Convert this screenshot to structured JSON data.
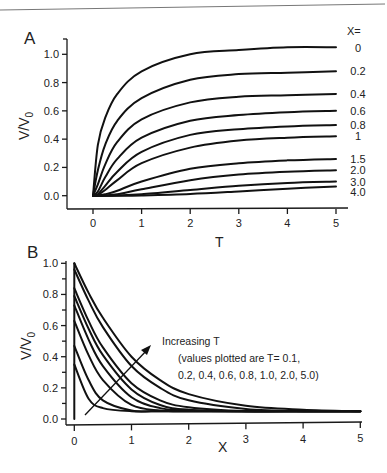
{
  "chart_data": [
    {
      "panel": "A",
      "type": "line",
      "title": "",
      "xlabel": "T",
      "ylabel": "V/V0",
      "xlim": [
        -0.5,
        5.1
      ],
      "ylim": [
        -0.1,
        1.1
      ],
      "xticks": [
        "0",
        "1",
        "2",
        "3",
        "4",
        "5"
      ],
      "yticks": [
        "0.0",
        "0.2",
        "0.4",
        "0.6",
        "0.8",
        "1.0"
      ],
      "legend_title": "X=",
      "grid": false,
      "x": [
        0,
        0.1,
        0.25,
        0.5,
        1,
        2,
        3,
        4,
        5
      ],
      "series": [
        {
          "name": "0",
          "values": [
            0,
            0.36,
            0.55,
            0.72,
            0.88,
            1.0,
            1.03,
            1.05,
            1.05
          ]
        },
        {
          "name": "0.2",
          "values": [
            0,
            0.18,
            0.36,
            0.53,
            0.69,
            0.82,
            0.86,
            0.87,
            0.88
          ]
        },
        {
          "name": "0.4",
          "values": [
            0,
            0.08,
            0.22,
            0.38,
            0.54,
            0.66,
            0.7,
            0.71,
            0.72
          ]
        },
        {
          "name": "0.6",
          "values": [
            0,
            0.03,
            0.13,
            0.26,
            0.41,
            0.53,
            0.57,
            0.59,
            0.6
          ]
        },
        {
          "name": "0.8",
          "values": [
            0,
            0.01,
            0.07,
            0.17,
            0.31,
            0.43,
            0.47,
            0.49,
            0.5
          ]
        },
        {
          "name": "1",
          "values": [
            0,
            0.005,
            0.04,
            0.11,
            0.23,
            0.34,
            0.39,
            0.41,
            0.42
          ]
        },
        {
          "name": "1.5",
          "values": [
            0,
            0,
            0.01,
            0.035,
            0.1,
            0.19,
            0.23,
            0.25,
            0.26
          ]
        },
        {
          "name": "2.0",
          "values": [
            0,
            0,
            0.002,
            0.01,
            0.045,
            0.11,
            0.15,
            0.17,
            0.18
          ]
        },
        {
          "name": "3.0",
          "values": [
            0,
            0,
            0,
            0.002,
            0.01,
            0.04,
            0.07,
            0.09,
            0.1
          ]
        },
        {
          "name": "4.0",
          "values": [
            0,
            0,
            0,
            0,
            0.002,
            0.012,
            0.03,
            0.05,
            0.065
          ]
        }
      ]
    },
    {
      "panel": "B",
      "type": "line",
      "title": "",
      "xlabel": "X",
      "ylabel": "V/V0",
      "xlim": [
        -0.1,
        5.1
      ],
      "ylim": [
        -0.04,
        1.02
      ],
      "xticks": [
        "0",
        "1",
        "2",
        "3",
        "4",
        "5"
      ],
      "yticks": [
        "0.0",
        "0.2",
        "0.4",
        "0.6",
        "0.8",
        "1.0"
      ],
      "grid": false,
      "annotation": {
        "line1": "Increasing T",
        "line2": "(values plotted are T= 0.1,",
        "line3": "0.2, 0.4, 0.6, 0.8, 1.0, 2.0, 5.0)"
      },
      "x": [
        0,
        0.25,
        0.5,
        1,
        1.5,
        2,
        3,
        4,
        5
      ],
      "series": [
        {
          "name": "T=0.1",
          "values": [
            0.35,
            0.13,
            0.07,
            0.05,
            0.05,
            0.05,
            0.05,
            0.05,
            0.05
          ]
        },
        {
          "name": "T=0.2",
          "values": [
            0.47,
            0.25,
            0.12,
            0.055,
            0.05,
            0.05,
            0.05,
            0.05,
            0.05
          ]
        },
        {
          "name": "T=0.4",
          "values": [
            0.63,
            0.41,
            0.25,
            0.09,
            0.055,
            0.05,
            0.05,
            0.05,
            0.05
          ]
        },
        {
          "name": "T=0.6",
          "values": [
            0.73,
            0.51,
            0.34,
            0.14,
            0.07,
            0.055,
            0.05,
            0.05,
            0.05
          ]
        },
        {
          "name": "T=0.8",
          "values": [
            0.79,
            0.58,
            0.41,
            0.19,
            0.09,
            0.06,
            0.05,
            0.05,
            0.05
          ]
        },
        {
          "name": "T=1.0",
          "values": [
            0.84,
            0.63,
            0.46,
            0.23,
            0.12,
            0.075,
            0.05,
            0.05,
            0.05
          ]
        },
        {
          "name": "T=2.0",
          "values": [
            0.96,
            0.76,
            0.59,
            0.34,
            0.2,
            0.12,
            0.065,
            0.05,
            0.05
          ]
        },
        {
          "name": "T=5.0",
          "values": [
            1.0,
            0.81,
            0.65,
            0.4,
            0.25,
            0.16,
            0.085,
            0.06,
            0.05
          ]
        }
      ]
    }
  ],
  "labels": {
    "panel_a": "A",
    "panel_b": "B",
    "ylabel_main": "V/V",
    "ylabel_sub": "0"
  }
}
